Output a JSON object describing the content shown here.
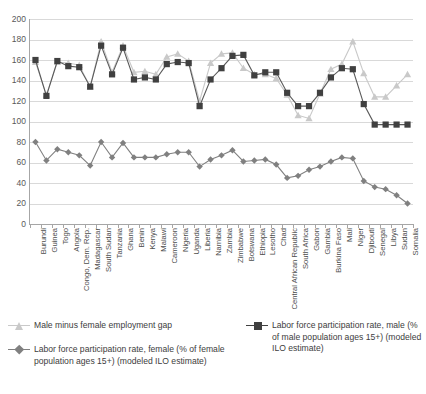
{
  "chart_data": {
    "type": "line",
    "title": "",
    "xlabel": "",
    "ylabel": "",
    "ylim": [
      0,
      200
    ],
    "ytick_step": 20,
    "yticks": [
      0,
      20,
      40,
      60,
      80,
      100,
      120,
      140,
      160,
      180,
      200
    ],
    "grid": true,
    "legend_position": "bottom",
    "categories": [
      "Burundi",
      "Guinea",
      "Togo",
      "Angola",
      "Congo, Dem. Rep.",
      "Madagascar",
      "South Sudan",
      "Tanzania",
      "Ghana",
      "Benin",
      "Kenya",
      "Malawi",
      "Cameroon",
      "Nigeria",
      "Uganda",
      "Liberia",
      "Namibia",
      "Zambia",
      "Zimbabwe",
      "Botswana",
      "Ethiopia",
      "Lesotho",
      "Chad",
      "Central African Republic",
      "South Africa",
      "Gabon",
      "Gambia",
      "Burkina Faso",
      "Mali",
      "Niger",
      "Djibouti",
      "Senegal",
      "Libya",
      "Sudan",
      "Somalia"
    ],
    "series": [
      {
        "name": "Male minus female employment gap",
        "marker": "triangle",
        "color": "#c9c9c9",
        "line_color": "#c9c9c9",
        "values": [
          158,
          126,
          158,
          157,
          155,
          134,
          178,
          148,
          174,
          148,
          149,
          146,
          163,
          166,
          159,
          120,
          157,
          166,
          167,
          152,
          146,
          146,
          142,
          126,
          106,
          103,
          127,
          151,
          156,
          178,
          147,
          124,
          124,
          135,
          146
        ]
      },
      {
        "name": "Labor force participation rate, male (% of male population ages 15+) (modeled ILO estimate)",
        "marker": "square",
        "color": "#404040",
        "line_color": "#595959",
        "values": [
          160,
          125,
          159,
          154,
          153,
          134,
          174,
          146,
          172,
          141,
          143,
          141,
          156,
          158,
          157,
          115,
          141,
          152,
          164,
          165,
          145,
          148,
          148,
          128,
          115,
          115,
          128,
          143,
          152,
          151,
          117,
          97,
          97,
          97,
          97
        ]
      },
      {
        "name": "Labor force participation rate, female (% of female population ages 15+) (modeled ILO estimate)",
        "marker": "diamond",
        "color": "#808080",
        "line_color": "#808080",
        "values": [
          80,
          62,
          73,
          70,
          67,
          57,
          80,
          65,
          79,
          65,
          65,
          65,
          68,
          70,
          70,
          56,
          63,
          67,
          72,
          61,
          62,
          63,
          58,
          45,
          47,
          53,
          56,
          61,
          65,
          64,
          42,
          36,
          34,
          28,
          20
        ]
      }
    ]
  },
  "legend": {
    "items": [
      {
        "label": "Male minus female employment gap",
        "marker": "triangle",
        "color": "#c9c9c9"
      },
      {
        "label": "Labor force participation rate, female (% of female population ages 15+) (modeled ILO estimate)",
        "marker": "diamond",
        "color": "#808080"
      },
      {
        "label": "Labor force participation rate, male (% of male population ages 15+) (modeled ILO estimate)",
        "marker": "square",
        "color": "#404040"
      }
    ]
  },
  "axis": {
    "y_tick_labels": [
      "200",
      "180",
      "160",
      "140",
      "120",
      "100",
      "80",
      "60",
      "40",
      "20",
      "0"
    ]
  }
}
